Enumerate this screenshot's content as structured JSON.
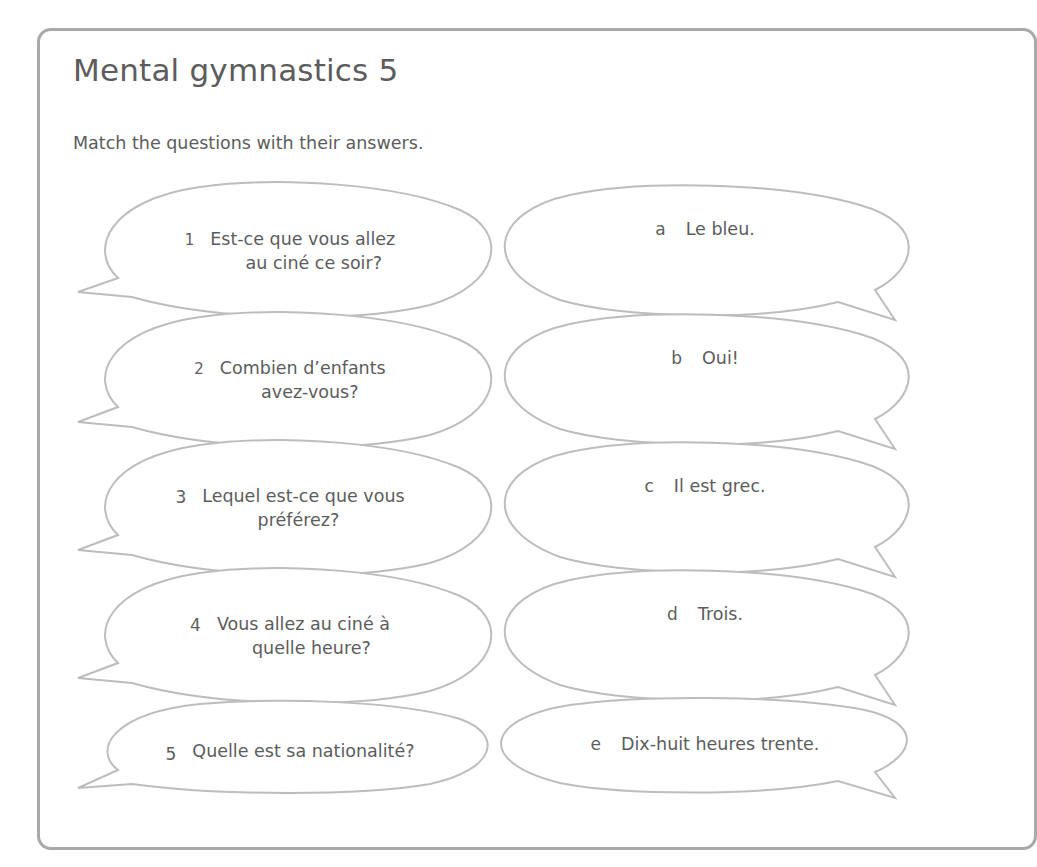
{
  "title": "Mental gymnastics 5",
  "instruction": "Match the questions with their answers.",
  "questions": [
    {
      "label": "1",
      "line1": "Est-ce que vous allez",
      "line2": "au ciné ce soir?"
    },
    {
      "label": "2",
      "line1": "Combien d’enfants",
      "line2": "avez-vous?"
    },
    {
      "label": "3",
      "line1": "Lequel est-ce que vous",
      "line2": "préférez?"
    },
    {
      "label": "4",
      "line1": "Vous allez au ciné à",
      "line2": "quelle heure?"
    },
    {
      "label": "5",
      "line1": "Quelle est sa nationalité?",
      "line2": ""
    }
  ],
  "answers": [
    {
      "label": "a",
      "text": "Le bleu."
    },
    {
      "label": "b",
      "text": "Oui!"
    },
    {
      "label": "c",
      "text": "Il est grec."
    },
    {
      "label": "d",
      "text": "Trois."
    },
    {
      "label": "e",
      "text": "Dix-huit heures trente."
    }
  ],
  "colors": {
    "text": "#5c5c5c",
    "card_border": "#a9a9a9",
    "bubble_outline": "#bdbdbd",
    "background": "#ffffff"
  }
}
